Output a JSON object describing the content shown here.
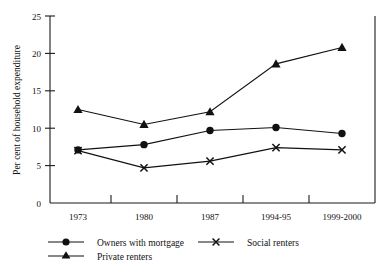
{
  "chart_data": {
    "type": "line",
    "title": "",
    "xlabel": "",
    "ylabel": "Per cent of household expenditure",
    "categories": [
      "1973",
      "1980",
      "1987",
      "1994-95",
      "1999-2000"
    ],
    "ylim": [
      0,
      25
    ],
    "yticks": [
      0,
      5,
      10,
      15,
      20,
      25
    ],
    "ytick_labels": [
      "0",
      "5",
      "10",
      "15",
      "20",
      "25"
    ],
    "grid": false,
    "legend_position": "bottom",
    "series": [
      {
        "name": "Owners with mortgage",
        "marker": "filled-circle",
        "values": [
          7.1,
          7.8,
          9.7,
          10.1,
          9.3
        ]
      },
      {
        "name": "Social renters",
        "marker": "cross",
        "values": [
          7.0,
          4.7,
          5.6,
          7.4,
          7.1
        ]
      },
      {
        "name": "Private renters",
        "marker": "filled-triangle",
        "values": [
          12.5,
          10.5,
          12.2,
          18.6,
          20.8
        ]
      }
    ]
  },
  "legend": {
    "items": [
      {
        "label": "Owners with mortgage",
        "marker": "filled-circle"
      },
      {
        "label": "Social renters",
        "marker": "cross"
      },
      {
        "label": "Private renters",
        "marker": "filled-triangle"
      }
    ]
  },
  "colors": {
    "ink": "#111111",
    "background": "#ffffff"
  }
}
